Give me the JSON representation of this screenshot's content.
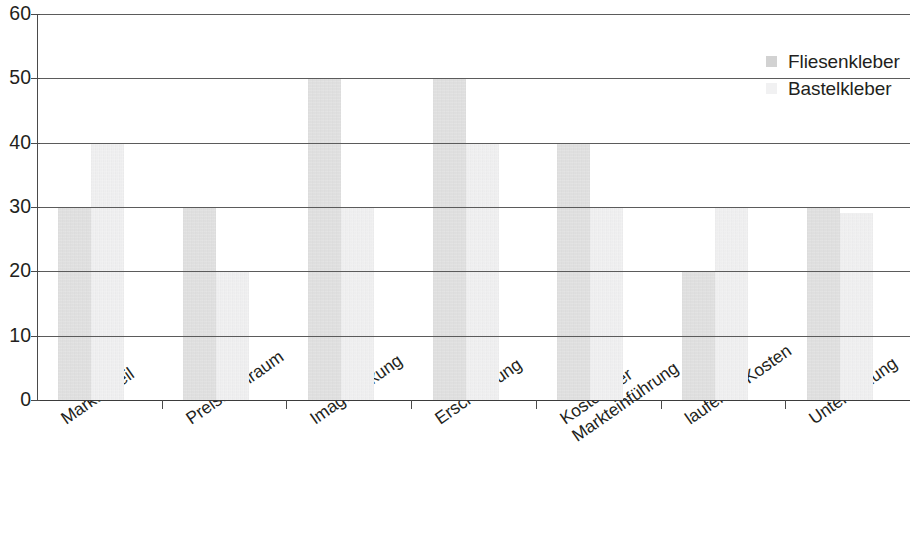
{
  "chart_data": {
    "type": "bar",
    "title": "",
    "subtitle": "",
    "xlabel": "",
    "ylabel": "",
    "ylim": [
      0,
      60
    ],
    "yticks": [
      0,
      10,
      20,
      30,
      40,
      50,
      60
    ],
    "ytick_labels": [
      "0",
      "10",
      "20",
      "30",
      "40",
      "50",
      "60"
    ],
    "grid": true,
    "grid_axis": "y",
    "legend_position": "top-right",
    "orientation": "vertical",
    "categories": [
      "Marktanteil",
      "Preisspielraum",
      "Imagewirkung",
      "Erschließung",
      "Kosten der Markteinführung",
      "laufende Kosten",
      "Unterstüzung"
    ],
    "category_lines": [
      [
        "Marktanteil"
      ],
      [
        "Preisspielraum"
      ],
      [
        "Imagewirkung"
      ],
      [
        "Erschließung"
      ],
      [
        "Kosten der",
        "Markteinführung"
      ],
      [
        "laufende Kosten"
      ],
      [
        "Unterstüzung"
      ]
    ],
    "series": [
      {
        "name": "Fliesenkleber",
        "color": "#dcdcdc",
        "values": [
          30,
          30,
          50,
          50,
          40,
          20,
          30
        ]
      },
      {
        "name": "Bastelkleber",
        "color": "#f0f0f1",
        "values": [
          40,
          20,
          30,
          40,
          30,
          30,
          29
        ]
      }
    ]
  },
  "legend": {
    "items": [
      {
        "label": "Fliesenkleber",
        "swatch": "#dcdcdc"
      },
      {
        "label": "Bastelkleber",
        "swatch": "#f0f0f1"
      }
    ]
  },
  "colors": {
    "series_1": "#dcdcdc",
    "series_2": "#f0f0f1",
    "axis": "#4a4a4a",
    "gridline": "#5b5b5b",
    "text": "#231f20",
    "background": "#ffffff"
  }
}
